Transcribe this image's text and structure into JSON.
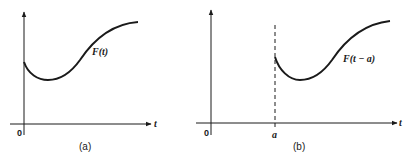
{
  "figure": {
    "panels": [
      {
        "caption": "(a)",
        "curve_label": "F(t)",
        "x_axis_label": "t",
        "origin_label": "0"
      },
      {
        "caption": "(b)",
        "curve_label": "F(t − a)",
        "x_axis_label": "t",
        "origin_label": "0",
        "shift_label": "a"
      }
    ],
    "colors": {
      "ink": "#1a1a1a",
      "background": "#ffffff"
    }
  }
}
